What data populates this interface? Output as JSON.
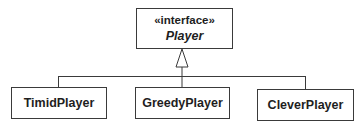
{
  "interface": {
    "stereotype": "«interface»",
    "name": "Player"
  },
  "classes": [
    {
      "name": "TimidPlayer"
    },
    {
      "name": "GreedyPlayer"
    },
    {
      "name": "CleverPlayer"
    }
  ],
  "relationship": "realization (generalization triangle)",
  "colors": {
    "line": "#3a3a3a",
    "background": "#ffffff",
    "text": "#1e1e1e"
  }
}
